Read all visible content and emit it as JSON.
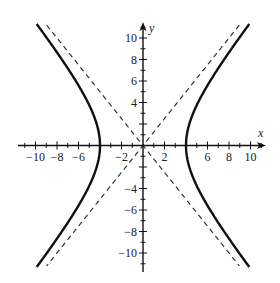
{
  "diagram": {
    "title": "",
    "type": "hyperbola graph",
    "equation": "x^2/16 - y^2/25 = 1",
    "axes": {
      "x_label": "x",
      "y_label": "y",
      "x_range": [
        -11.5,
        11.5
      ],
      "y_range": [
        -11.5,
        11.5
      ],
      "x_tick_labels": [
        "-10",
        "-8",
        "-6",
        "-2",
        "2",
        "6",
        "8",
        "10"
      ],
      "x_tick_values": [
        -10,
        -8,
        -6,
        -2,
        2,
        6,
        8,
        10
      ],
      "y_tick_labels": [
        "10",
        "8",
        "6",
        "4",
        "-4",
        "-6",
        "-8",
        "-10"
      ],
      "y_tick_values": [
        10,
        8,
        6,
        4,
        -4,
        -6,
        -8,
        -10
      ],
      "minor_tick_step": 1
    },
    "curves": [
      {
        "name": "hyperbola-right-branch",
        "style": "solid",
        "color": "#111111"
      },
      {
        "name": "hyperbola-left-branch",
        "style": "solid",
        "color": "#111111"
      }
    ],
    "asymptotes": [
      {
        "name": "asymptote-positive-slope",
        "equation": "y = 5x/4",
        "style": "dashed",
        "color": "#333333"
      },
      {
        "name": "asymptote-negative-slope",
        "equation": "y = -5x/4",
        "style": "dashed",
        "color": "#333333"
      }
    ],
    "parameters": {
      "a": 4,
      "b": 5,
      "vertices": [
        [
          -4,
          0
        ],
        [
          4,
          0
        ]
      ]
    }
  }
}
